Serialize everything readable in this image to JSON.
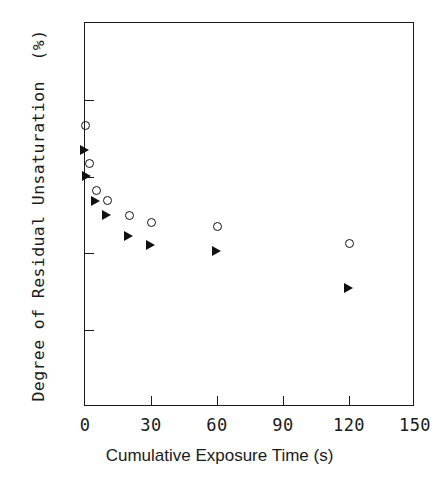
{
  "chart_data": {
    "type": "scatter",
    "title": "",
    "xlabel": "Cumulative Exposure Time (s)",
    "ylabel": "Degree of Residual Unsaturation  (%)",
    "xlim": [
      0,
      150
    ],
    "ylim": [
      0,
      100
    ],
    "xticks": [
      0,
      30,
      60,
      90,
      120,
      150
    ],
    "xtick_labels": [
      "0",
      "30",
      "60",
      "90",
      "120",
      "150"
    ],
    "yticks": [
      0,
      20,
      40,
      60,
      80,
      100
    ],
    "ytick_labels": [
      "0",
      "20",
      "40",
      "60",
      "80",
      "100"
    ],
    "grid": false,
    "legend": "none",
    "frame": "box",
    "tick_direction": "in",
    "series": [
      {
        "name": "open-circle-series",
        "marker": "open-circle",
        "color": "#111111",
        "points": [
          {
            "x": 0,
            "y": 73.4
          },
          {
            "x": 2,
            "y": 63.5
          },
          {
            "x": 5,
            "y": 56.5
          },
          {
            "x": 10,
            "y": 53.7
          },
          {
            "x": 20,
            "y": 50.0
          },
          {
            "x": 30,
            "y": 48.0
          },
          {
            "x": 60,
            "y": 47.1
          },
          {
            "x": 120,
            "y": 42.5
          }
        ]
      },
      {
        "name": "filled-triangle-series",
        "marker": "filled-right-triangle",
        "color": "#111111",
        "points": [
          {
            "x": 0,
            "y": 66.7
          },
          {
            "x": 1,
            "y": 60.0
          },
          {
            "x": 5,
            "y": 53.5
          },
          {
            "x": 10,
            "y": 50.0
          },
          {
            "x": 20,
            "y": 44.5
          },
          {
            "x": 30,
            "y": 42.0
          },
          {
            "x": 60,
            "y": 40.6
          },
          {
            "x": 120,
            "y": 30.8
          }
        ]
      }
    ]
  }
}
